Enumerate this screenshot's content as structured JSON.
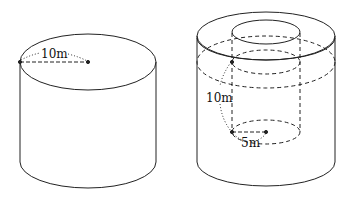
{
  "figures": [
    {
      "name": "solid-cylinder",
      "labels": {
        "radius": "10m"
      }
    },
    {
      "name": "hollow-cylinder",
      "labels": {
        "height": "10m",
        "inner_radius": "5m"
      }
    }
  ],
  "colors": {
    "stroke": "#222222",
    "background": "#ffffff"
  }
}
